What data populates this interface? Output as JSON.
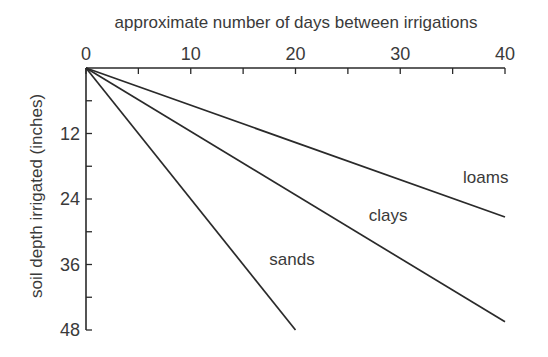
{
  "chart_data": {
    "type": "line",
    "title": "",
    "xlabel": "approximate number of days between irrigations",
    "ylabel": "soil depth irrigated (inches)",
    "x_ticks": [
      0,
      10,
      20,
      30,
      40
    ],
    "y_ticks": [
      12,
      24,
      36,
      48
    ],
    "xlim": [
      0,
      40
    ],
    "ylim": [
      0,
      48
    ],
    "y_inverted": true,
    "x_axis_position": "top",
    "grid": false,
    "legend": "inline labels",
    "series": [
      {
        "name": "loams",
        "x": [
          0,
          40
        ],
        "y": [
          0,
          27.3
        ]
      },
      {
        "name": "clays",
        "x": [
          0,
          40
        ],
        "y": [
          0,
          46.5
        ]
      },
      {
        "name": "sands",
        "x": [
          0,
          20
        ],
        "y": [
          0,
          48
        ]
      }
    ],
    "annotations": [
      {
        "text": "loams",
        "x": 36,
        "y": 21
      },
      {
        "text": "clays",
        "x": 27,
        "y": 28
      },
      {
        "text": "sands",
        "x": 17.5,
        "y": 36
      }
    ]
  },
  "colors": {
    "line": "#2a2a2a",
    "text": "#3a3a3a",
    "background": "#ffffff"
  }
}
